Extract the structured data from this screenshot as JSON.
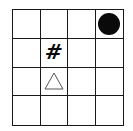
{
  "board": {
    "rows": 4,
    "cols": 4,
    "pieces": [
      {
        "row": 0,
        "col": 3,
        "type": "circle",
        "icon": "filled-circle-icon",
        "color": "#0a0a0a"
      },
      {
        "row": 1,
        "col": 1,
        "type": "hash",
        "symbol": "#",
        "icon": "hash-icon",
        "color": "#0a0a0a"
      },
      {
        "row": 2,
        "col": 1,
        "type": "triangle",
        "icon": "triangle-outline-icon",
        "color": "#555555"
      }
    ]
  }
}
